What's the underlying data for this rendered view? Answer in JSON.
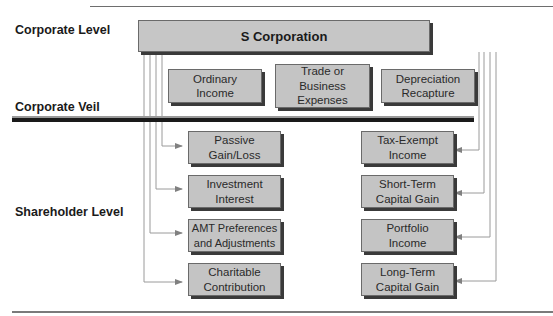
{
  "levels": {
    "corporate_level": "Corporate Level",
    "corporate_veil": "Corporate Veil",
    "shareholder_level": "Shareholder Level"
  },
  "entity": {
    "label": "S Corporation"
  },
  "corporate_items": [
    {
      "label": "Ordinary Income"
    },
    {
      "label": "Trade or Business Expenses"
    },
    {
      "label": "Depreciation Recapture"
    }
  ],
  "shareholder_items_left": [
    {
      "label": "Passive Gain/Loss"
    },
    {
      "label": "Investment Interest"
    },
    {
      "label": "AMT Preferences and Adjustments"
    },
    {
      "label": "Charitable Contribution"
    }
  ],
  "shareholder_items_right": [
    {
      "label": "Tax-Exempt Income"
    },
    {
      "label": "Short-Term Capital Gain"
    },
    {
      "label": "Portfolio Income"
    },
    {
      "label": "Long-Term Capital Gain"
    }
  ],
  "colors": {
    "box_fill": "#c4c4c4",
    "box_shadow": "#3a3a3a",
    "veil_line": "#1a1a1a",
    "connector": "#808080"
  }
}
